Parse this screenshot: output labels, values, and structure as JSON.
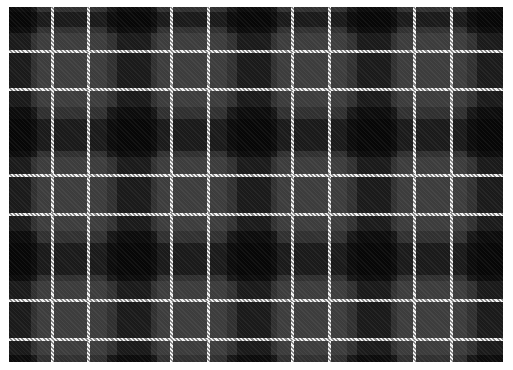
{
  "image": {
    "subject": "tartan plaid fabric pattern",
    "colors": {
      "background": "#ffffff",
      "base": "#161616",
      "grey_band": "#3c3c3c",
      "dark_block": "#0a0a0a",
      "stripe": "#f2f2f2"
    },
    "vertical_stripes_x": [
      52,
      88,
      171,
      208,
      292,
      329,
      414,
      451
    ],
    "horizontal_stripes_y": [
      51,
      89,
      175,
      214,
      300,
      339
    ]
  }
}
